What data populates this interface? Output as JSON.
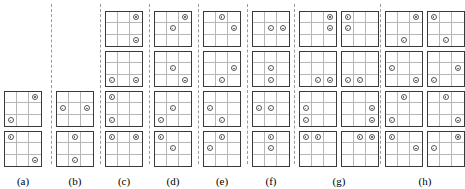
{
  "figure": {
    "title": "",
    "marker_icon": "small-circle-marker",
    "grid_size": 3,
    "colors": {
      "grid_border": "#3a3a3a",
      "grid_line": "#b6b6b6",
      "marker": "#555555",
      "divider": "#9a9a9a",
      "background": "#ffffff"
    }
  },
  "panels": [
    {
      "label": "(a)",
      "x": 4,
      "columns": [
        {
          "grids": [
            {
              "markers": [
                [
                  0,
                  0
                ],
                [
                  2,
                  2
                ]
              ]
            },
            {
              "markers": [
                [
                  0,
                  2
                ],
                [
                  2,
                  0
                ]
              ]
            }
          ]
        }
      ]
    },
    {
      "label": "(b)",
      "x": 56,
      "columns": [
        {
          "grids": [
            {
              "markers": [
                [
                  0,
                  1
                ],
                [
                  2,
                  1
                ]
              ]
            },
            {
              "markers": [
                [
                  1,
                  0
                ],
                [
                  1,
                  2
                ]
              ]
            }
          ]
        }
      ]
    },
    {
      "label": "(c)",
      "x": 105,
      "columns": [
        {
          "grids": [
            {
              "markers": [
                [
                  0,
                  0
                ],
                [
                  0,
                  2
                ]
              ]
            },
            {
              "markers": [
                [
                  0,
                  0
                ],
                [
                  2,
                  0
                ]
              ]
            },
            {
              "markers": [
                [
                  2,
                  0
                ],
                [
                  2,
                  2
                ]
              ]
            },
            {
              "markers": [
                [
                  0,
                  2
                ],
                [
                  2,
                  2
                ]
              ]
            }
          ]
        }
      ]
    },
    {
      "label": "(d)",
      "x": 154,
      "columns": [
        {
          "grids": [
            {
              "markers": [
                [
                  0,
                  0
                ],
                [
                  1,
                  1
                ]
              ]
            },
            {
              "markers": [
                [
                  1,
                  1
                ],
                [
                  2,
                  0
                ]
              ]
            },
            {
              "markers": [
                [
                  1,
                  1
                ],
                [
                  2,
                  2
                ]
              ]
            },
            {
              "markers": [
                [
                  0,
                  2
                ],
                [
                  1,
                  1
                ]
              ]
            }
          ]
        }
      ]
    },
    {
      "label": "(e)",
      "x": 203,
      "columns": [
        {
          "grids": [
            {
              "markers": [
                [
                  0,
                  1
                ],
                [
                  1,
                  0
                ]
              ]
            },
            {
              "markers": [
                [
                  1,
                  0
                ],
                [
                  2,
                  1
                ]
              ]
            },
            {
              "markers": [
                [
                  1,
                  2
                ],
                [
                  2,
                  1
                ]
              ]
            },
            {
              "markers": [
                [
                  0,
                  1
                ],
                [
                  1,
                  2
                ]
              ]
            }
          ]
        }
      ]
    },
    {
      "label": "(f)",
      "x": 252,
      "columns": [
        {
          "grids": [
            {
              "markers": [
                [
                  0,
                  1
                ],
                [
                  1,
                  1
                ]
              ]
            },
            {
              "markers": [
                [
                  1,
                  0
                ],
                [
                  1,
                  1
                ]
              ]
            },
            {
              "markers": [
                [
                  1,
                  1
                ],
                [
                  2,
                  1
                ]
              ]
            },
            {
              "markers": [
                [
                  1,
                  1
                ],
                [
                  1,
                  2
                ]
              ]
            }
          ]
        }
      ]
    },
    {
      "label": "(g)",
      "x": 299,
      "columns": [
        {
          "grids": [
            {
              "markers": [
                [
                  0,
                  0
                ],
                [
                  0,
                  1
                ]
              ]
            },
            {
              "markers": [
                [
                  1,
                  0
                ],
                [
                  2,
                  0
                ]
              ]
            },
            {
              "markers": [
                [
                  2,
                  1
                ],
                [
                  2,
                  2
                ]
              ]
            },
            {
              "markers": [
                [
                  0,
                  2
                ],
                [
                  1,
                  2
                ]
              ]
            }
          ]
        },
        {
          "grids": [
            {
              "markers": [
                [
                  0,
                  1
                ],
                [
                  0,
                  2
                ]
              ]
            },
            {
              "markers": [
                [
                  1,
                  2
                ],
                [
                  2,
                  2
                ]
              ]
            },
            {
              "markers": [
                [
                  2,
                  0
                ],
                [
                  2,
                  1
                ]
              ]
            },
            {
              "markers": [
                [
                  0,
                  0
                ],
                [
                  1,
                  0
                ]
              ]
            }
          ]
        }
      ]
    },
    {
      "label": "(h)",
      "x": 385,
      "columns": [
        {
          "grids": [
            {
              "markers": [
                [
                  0,
                  0
                ],
                [
                  1,
                  2
                ]
              ]
            },
            {
              "markers": [
                [
                  0,
                  1
                ],
                [
                  2,
                  0
                ]
              ]
            },
            {
              "markers": [
                [
                  1,
                  0
                ],
                [
                  2,
                  2
                ]
              ]
            },
            {
              "markers": [
                [
                  0,
                  2
                ],
                [
                  2,
                  1
                ]
              ]
            }
          ]
        },
        {
          "grids": [
            {
              "markers": [
                [
                  0,
                  2
                ],
                [
                  1,
                  0
                ]
              ]
            },
            {
              "markers": [
                [
                  0,
                  1
                ],
                [
                  2,
                  2
                ]
              ]
            },
            {
              "markers": [
                [
                  1,
                  2
                ],
                [
                  2,
                  0
                ]
              ]
            },
            {
              "markers": [
                [
                  0,
                  0
                ],
                [
                  2,
                  1
                ]
              ]
            }
          ]
        }
      ]
    }
  ],
  "dividers": [
    {
      "x": 51
    },
    {
      "x": 100
    },
    {
      "x": 149
    },
    {
      "x": 198
    },
    {
      "x": 247
    },
    {
      "x": 294
    },
    {
      "x": 380
    }
  ]
}
